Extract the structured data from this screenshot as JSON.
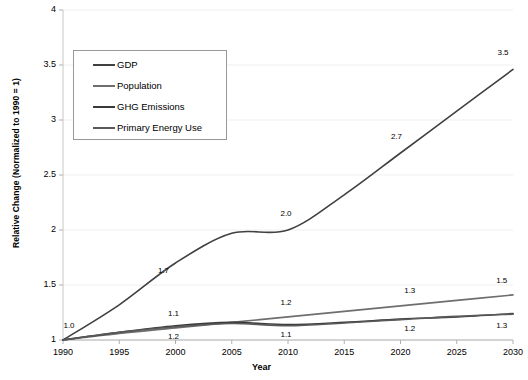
{
  "chart_data": {
    "type": "line",
    "title": "",
    "xlabel": "Year",
    "ylabel": "Relative Change (Normalized to 1990 = 1)",
    "xlim": [
      1990,
      2030
    ],
    "ylim": [
      1,
      4
    ],
    "grid": true,
    "legend_position": "upper-left",
    "x_ticks": [
      "1990",
      "1995",
      "2000",
      "2005",
      "2010",
      "2015",
      "2020",
      "2025",
      "2030"
    ],
    "y_ticks": [
      "1",
      "1.5",
      "2",
      "2.5",
      "3",
      "3.5",
      "4"
    ],
    "x": [
      1990,
      1995,
      2000,
      2005,
      2010,
      2015,
      2020,
      2025,
      2030
    ],
    "series": [
      {
        "name": "GDP",
        "color": "#404040",
        "values": [
          1.0,
          1.32,
          1.7,
          1.97,
          2.0,
          2.32,
          2.7,
          3.08,
          3.46
        ]
      },
      {
        "name": "Population",
        "color": "#6e6e6e",
        "values": [
          1.0,
          1.06,
          1.11,
          1.16,
          1.21,
          1.26,
          1.31,
          1.36,
          1.41
        ]
      },
      {
        "name": "GHG Emissions",
        "color": "#3a3a3a",
        "values": [
          1.0,
          1.07,
          1.13,
          1.16,
          1.14,
          1.16,
          1.19,
          1.21,
          1.24
        ]
      },
      {
        "name": "Primary Energy Use",
        "color": "#595959",
        "values": [
          1.0,
          1.07,
          1.12,
          1.15,
          1.13,
          1.155,
          1.185,
          1.215,
          1.235
        ]
      }
    ],
    "annotations": [
      {
        "text": "1.0",
        "x": 1990,
        "y": 1.0,
        "dx": 6,
        "dy": -14
      },
      {
        "text": "1.7",
        "x": 2000,
        "y": 1.7,
        "dx": -12,
        "dy": 8
      },
      {
        "text": "2.0",
        "x": 2010,
        "y": 2.0,
        "dx": -2,
        "dy": -16
      },
      {
        "text": "2.7",
        "x": 2020,
        "y": 2.7,
        "dx": -4,
        "dy": -16
      },
      {
        "text": "3.5",
        "x": 2030,
        "y": 3.46,
        "dx": -10,
        "dy": -16
      },
      {
        "text": "1.1",
        "x": 2000,
        "y": 1.12,
        "dx": -2,
        "dy": -13
      },
      {
        "text": "1.2",
        "x": 2000,
        "y": 1.12,
        "dx": -2,
        "dy": 10
      },
      {
        "text": "1.2",
        "x": 2010,
        "y": 1.21,
        "dx": -2,
        "dy": -14
      },
      {
        "text": "1.1",
        "x": 2010,
        "y": 1.14,
        "dx": -2,
        "dy": 10
      },
      {
        "text": "1.3",
        "x": 2021,
        "y": 1.32,
        "dx": -2,
        "dy": -14
      },
      {
        "text": "1.2",
        "x": 2021,
        "y": 1.19,
        "dx": -2,
        "dy": 10
      },
      {
        "text": "1.5",
        "x": 2029,
        "y": 1.41,
        "dx": 0,
        "dy": -14
      },
      {
        "text": "1.3",
        "x": 2029,
        "y": 1.24,
        "dx": 0,
        "dy": 12
      }
    ]
  }
}
